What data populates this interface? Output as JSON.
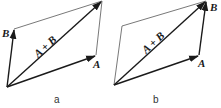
{
  "figure": {
    "panels": [
      {
        "caption": "a",
        "vectors": {
          "A": {
            "label": "A"
          },
          "B": {
            "label": "B"
          },
          "sum": {
            "label": "A + B"
          }
        },
        "description": "Parallelogram rule: A and B drawn from common origin, A + B is the diagonal"
      },
      {
        "caption": "b",
        "vectors": {
          "A": {
            "label": "A"
          },
          "B": {
            "label": "B"
          },
          "sum": {
            "label": "A + B"
          }
        },
        "description": "Triangle rule: B drawn from tip of A, A + B from origin to tip of B"
      }
    ]
  }
}
